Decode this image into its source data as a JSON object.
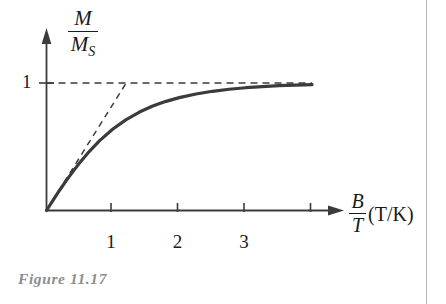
{
  "figure": {
    "caption": "Figure 11.17",
    "axes": {
      "y_label_numerator": "M",
      "y_label_denominator": "M",
      "y_label_denominator_subscript": "S",
      "x_label_numerator": "B",
      "x_label_denominator": "T",
      "x_label_units": "(T/K)",
      "y_tick_labels": [
        "1"
      ],
      "x_tick_labels": [
        "1",
        "2",
        "3"
      ]
    },
    "colors": {
      "curve": "#3b3b3b",
      "axis": "#3b3b3b",
      "dashed": "#3b3b3b",
      "caption": "#8d8d8d",
      "column_rule": "#b9b9b9",
      "background": "#ffffff"
    }
  },
  "chart_data": {
    "type": "line",
    "title": "",
    "subtitle": "",
    "xlabel": "B/T (T/K)",
    "ylabel": "M/M_S",
    "xlim": [
      0,
      4.3
    ],
    "ylim": [
      0,
      1.12
    ],
    "grid": false,
    "legend": false,
    "x_ticks": [
      1,
      2,
      3,
      4
    ],
    "x_tick_labels": [
      "1",
      "2",
      "3",
      ""
    ],
    "y_ticks": [
      1
    ],
    "y_tick_labels": [
      "1"
    ],
    "series": [
      {
        "name": "magnetization curve",
        "style": "solid",
        "x": [
          0.0,
          0.1,
          0.2,
          0.3,
          0.4,
          0.5,
          0.65,
          0.8,
          1.0,
          1.2,
          1.4,
          1.6,
          1.8,
          2.0,
          2.25,
          2.5,
          2.75,
          3.0,
          3.25,
          3.5,
          3.75,
          4.0
        ],
        "y": [
          0.0,
          0.082,
          0.161,
          0.236,
          0.307,
          0.374,
          0.466,
          0.548,
          0.639,
          0.713,
          0.772,
          0.819,
          0.856,
          0.885,
          0.914,
          0.935,
          0.951,
          0.963,
          0.972,
          0.979,
          0.984,
          0.988
        ]
      },
      {
        "name": "initial slope tangent",
        "style": "dashed",
        "x": [
          0.0,
          1.2
        ],
        "y": [
          0.0,
          1.0
        ]
      },
      {
        "name": "saturation asymptote",
        "style": "dashed",
        "x": [
          0.0,
          4.0
        ],
        "y": [
          1.0,
          1.0
        ]
      }
    ],
    "annotations": [
      {
        "text": "saturation value M/M_S = 1 shown as horizontal dashed line"
      },
      {
        "text": "dashed straight line is the low-field (Curie law) initial slope, reaching saturation at B/T = 1.2"
      }
    ]
  }
}
